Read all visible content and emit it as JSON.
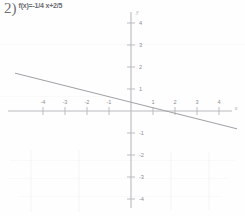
{
  "problem": {
    "number_label": "2)",
    "equation": "f(x)=-1/4 x+2/5"
  },
  "axes": {
    "x_axis_letter": "x",
    "y_axis_letter": "y",
    "x_tick_labels": [
      "-4",
      "-3",
      "-2",
      "-1",
      "1",
      "2",
      "3",
      "4"
    ],
    "y_tick_labels": [
      "4",
      "3",
      "2",
      "1",
      "-1",
      "-2",
      "-3",
      "-4"
    ]
  },
  "chart_data": {
    "type": "line",
    "title": "f(x)=-1/4 x+2/5",
    "xlabel": "x",
    "ylabel": "y",
    "xlim": [
      -5.3,
      5.2
    ],
    "ylim": [
      -4.8,
      4.6
    ],
    "grid": false,
    "legend": "none",
    "slope": -0.25,
    "intercept": 0.4,
    "x_ticks": [
      -4,
      -3,
      -2,
      -1,
      1,
      2,
      3,
      4
    ],
    "y_ticks": [
      4,
      3,
      2,
      1,
      -1,
      -2,
      -3,
      -4
    ],
    "series": [
      {
        "name": "f(x)=-1/4 x+2/5",
        "x": [
          -5.27,
          4.82
        ],
        "values": [
          1.72,
          -0.81
        ]
      }
    ],
    "annotations": [
      "2)"
    ]
  },
  "geometry": {
    "origin_x": 131,
    "origin_y": 111,
    "unit_px": 22,
    "line_x1": 15,
    "line_y1": 80,
    "line_x2": 237,
    "line_y2": 130
  }
}
